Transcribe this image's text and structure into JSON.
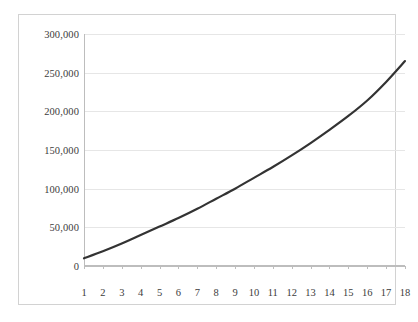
{
  "chart_data": {
    "type": "line",
    "title": "",
    "subtitle": "",
    "xlabel": "",
    "ylabel": "",
    "x": [
      1,
      2,
      3,
      4,
      5,
      6,
      7,
      8,
      9,
      10,
      11,
      12,
      13,
      14,
      15,
      16,
      17,
      18
    ],
    "categories": [
      "1",
      "2",
      "3",
      "4",
      "5",
      "6",
      "7",
      "8",
      "9",
      "10",
      "11",
      "12",
      "13",
      "14",
      "15",
      "16",
      "17",
      "18"
    ],
    "series": [
      {
        "name": "series-1",
        "color": "#333333",
        "values": [
          10000,
          19000,
          29000,
          40000,
          51000,
          62000,
          74000,
          87000,
          100000,
          114000,
          128000,
          143000,
          159000,
          176000,
          194000,
          214000,
          238000,
          265000
        ]
      }
    ],
    "values": [
      10000,
      19000,
      29000,
      40000,
      51000,
      62000,
      74000,
      87000,
      100000,
      114000,
      128000,
      143000,
      159000,
      176000,
      194000,
      214000,
      238000,
      265000
    ],
    "ylim": [
      0,
      300000
    ],
    "xlim": [
      1,
      18
    ],
    "yticks": [
      0,
      50000,
      100000,
      150000,
      200000,
      250000,
      300000
    ],
    "ytick_labels": [
      "0",
      "50,000",
      "100,000",
      "150,000",
      "200,000",
      "250,000",
      "300,000"
    ],
    "xtick_labels": [
      "1",
      "2",
      "3",
      "4",
      "5",
      "6",
      "7",
      "8",
      "9",
      "10",
      "11",
      "12",
      "13",
      "14",
      "15",
      "16",
      "17",
      "18"
    ],
    "grid": {
      "horizontal": true,
      "vertical": false,
      "color": "#e6e6e6"
    },
    "legend": {
      "visible": false,
      "position": "none",
      "entries": []
    },
    "colors": {
      "line": "#333333",
      "gridline": "#e6e6e6",
      "axis": "#bdbdbd",
      "frame": "#d2d2d2",
      "tick_text": "#3c3c3c",
      "background": "#ffffff"
    },
    "line_width": 2.2,
    "markers": false
  }
}
